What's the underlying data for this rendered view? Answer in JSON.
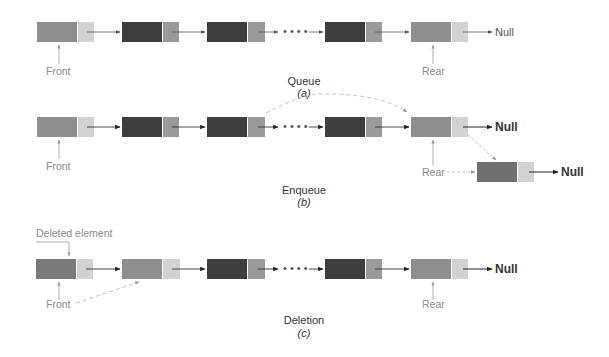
{
  "colors": {
    "node_medium": "#8e8e8e",
    "node_dark": "#3e3e3e",
    "pointer_light": "#d2d2d2",
    "pointer_medium": "#9a9a9a",
    "arrow": "#555555",
    "dashed": "#bbbbbb",
    "label_gray": "#8a8a8a"
  },
  "diagrams": {
    "a": {
      "caption": "Queue",
      "sub": "(a)",
      "front_label": "Front",
      "rear_label": "Rear",
      "null_label": "Null",
      "ellipsis": "• • • •"
    },
    "b": {
      "caption": "Enqueue",
      "sub": "(b)",
      "front_label": "Front",
      "rear_label": "Rear",
      "null_label": "Null",
      "new_null_label": "Null",
      "ellipsis": "• • • •"
    },
    "c": {
      "caption": "Deletion",
      "sub": "(c)",
      "deleted_label": "Deleted element",
      "front_label": "Front",
      "rear_label": "Rear",
      "null_label": "Null",
      "ellipsis": "• • • •"
    }
  }
}
